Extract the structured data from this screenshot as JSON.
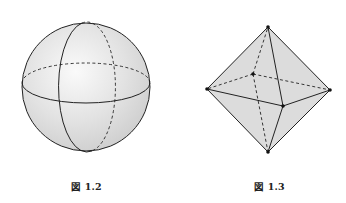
{
  "figures": [
    {
      "caption": "図 1.2",
      "shape": "sphere",
      "center": [
        86,
        87
      ],
      "radius": 64,
      "fill_color": "#e4e4e4"
    },
    {
      "caption": "図 1.3",
      "shape": "octahedron",
      "vertices": {
        "top": [
          268,
          27
        ],
        "left": [
          207,
          89
        ],
        "right": [
          330,
          90
        ],
        "bottom": [
          268,
          152
        ],
        "front": [
          283,
          106
        ],
        "back": [
          253,
          74
        ]
      },
      "fill_color": "#dadada"
    }
  ]
}
